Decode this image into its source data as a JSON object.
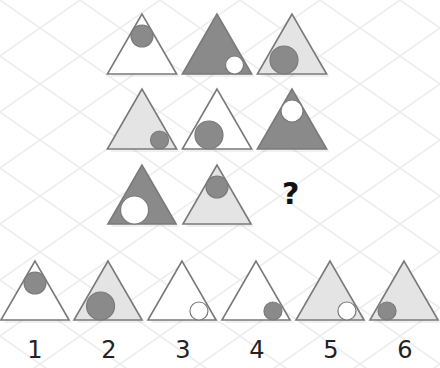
{
  "colors": {
    "dark_fill": "#8a8a8a",
    "light_fill": "#e4e4e4",
    "white_fill": "#ffffff",
    "outline": "#7a7a7a",
    "grid": "#ececec"
  },
  "matrix": {
    "rows": [
      [
        {
          "tri_fill": "white",
          "circle_fill": "dark",
          "circle_pos": "top",
          "circle_size": "medium"
        },
        {
          "tri_fill": "dark",
          "circle_fill": "white",
          "circle_pos": "bottom-right",
          "circle_size": "small"
        },
        {
          "tri_fill": "light",
          "circle_fill": "dark",
          "circle_pos": "bottom-left",
          "circle_size": "large"
        }
      ],
      [
        {
          "tri_fill": "light",
          "circle_fill": "dark",
          "circle_pos": "bottom-right",
          "circle_size": "small"
        },
        {
          "tri_fill": "white",
          "circle_fill": "dark",
          "circle_pos": "bottom-left",
          "circle_size": "large"
        },
        {
          "tri_fill": "dark",
          "circle_fill": "white",
          "circle_pos": "top",
          "circle_size": "medium"
        }
      ],
      [
        {
          "tri_fill": "dark",
          "circle_fill": "white",
          "circle_pos": "bottom-left",
          "circle_size": "large"
        },
        {
          "tri_fill": "light",
          "circle_fill": "dark",
          "circle_pos": "top",
          "circle_size": "medium"
        },
        null
      ]
    ],
    "missing_symbol": "?"
  },
  "options": [
    {
      "label": "1",
      "tri_fill": "white",
      "circle_fill": "dark",
      "circle_pos": "top",
      "circle_size": "medium"
    },
    {
      "label": "2",
      "tri_fill": "light",
      "circle_fill": "dark",
      "circle_pos": "bottom-left",
      "circle_size": "large"
    },
    {
      "label": "3",
      "tri_fill": "white",
      "circle_fill": "white",
      "circle_pos": "bottom-right",
      "circle_size": "small"
    },
    {
      "label": "4",
      "tri_fill": "white",
      "circle_fill": "dark",
      "circle_pos": "bottom-right",
      "circle_size": "small"
    },
    {
      "label": "5",
      "tri_fill": "light",
      "circle_fill": "white",
      "circle_pos": "bottom-right",
      "circle_size": "small"
    },
    {
      "label": "6",
      "tri_fill": "light",
      "circle_fill": "dark",
      "circle_pos": "bottom-left",
      "circle_size": "small"
    }
  ]
}
